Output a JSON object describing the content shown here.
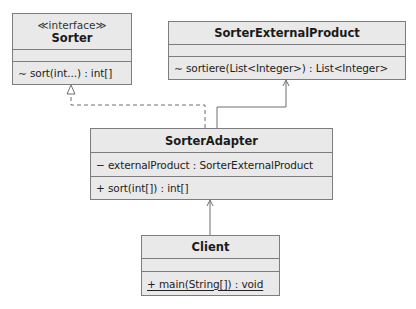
{
  "diagram": {
    "type": "UML class diagram",
    "classes": {
      "sorter": {
        "stereotype": "≪interface≫",
        "name": "Sorter",
        "attributes": [],
        "operations": [
          "∼ sort(int...) : int[]"
        ]
      },
      "external_product": {
        "name": "SorterExternalProduct",
        "attributes": [],
        "operations": [
          "∼ sortiere(List<Integer>) : List<Integer>"
        ]
      },
      "adapter": {
        "name": "SorterAdapter",
        "attributes": [
          "− externalProduct : SorterExternalProduct"
        ],
        "operations": [
          "+ sort(int[]) : int[]"
        ]
      },
      "client": {
        "name": "Client",
        "attributes": [],
        "operations": [
          "+ main(String[]) : void"
        ],
        "static_operations": [
          "+ main(String[]) : void"
        ]
      }
    },
    "relationships": [
      {
        "from": "SorterAdapter",
        "to": "Sorter",
        "kind": "realization",
        "line": "dashed",
        "head": "hollow-triangle"
      },
      {
        "from": "SorterAdapter",
        "to": "SorterExternalProduct",
        "kind": "association",
        "line": "solid",
        "head": "open-arrow"
      },
      {
        "from": "Client",
        "to": "SorterAdapter",
        "kind": "association",
        "line": "solid",
        "head": "open-arrow"
      }
    ],
    "colors": {
      "class_fill": "#e9e9e9",
      "class_border": "#7d7d7d",
      "connector": "#6f6f6f",
      "background": "#ffffff"
    }
  }
}
